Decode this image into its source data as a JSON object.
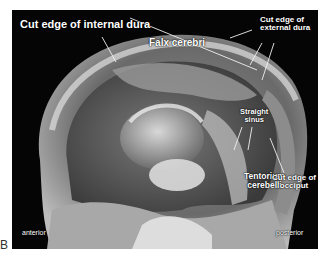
{
  "figure": {
    "panel_letter": "B",
    "background_color": "#ffffff",
    "photo_background": "#050505"
  },
  "labels": {
    "cut_edge_internal_dura": "Cut edge of internal dura",
    "cut_edge_external_dura_line1": "Cut edge of",
    "cut_edge_external_dura_line2": "external dura",
    "falx_cerebri": "Falx cerebri",
    "straight_sinus_line1": "Straight",
    "straight_sinus_line2": "sinus",
    "tentorium_line1": "Tentorium",
    "tentorium_line2": "cerebelli",
    "cut_edge_occiput_line1": "Cut edge of",
    "cut_edge_occiput_line2": "occiput",
    "anterior": "anterior",
    "posterior": "posterior"
  },
  "colors": {
    "label_text": "#ffffff",
    "leader_lines": "#f0f0f0"
  }
}
